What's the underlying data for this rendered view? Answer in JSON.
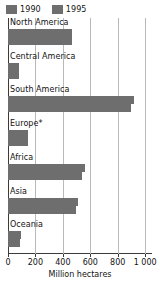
{
  "chart_data": {
    "type": "bar",
    "orientation": "horizontal",
    "title": "",
    "subtitle": "",
    "xlabel": "Million hectares",
    "ylabel": "",
    "xlim": [
      0,
      1050
    ],
    "xticks": [
      0,
      200,
      400,
      600,
      800,
      1000
    ],
    "xticklabels": [
      "0",
      "200",
      "400",
      "600",
      "800",
      "1 000"
    ],
    "grid": true,
    "legend_position": "top-left",
    "categories": [
      "North America",
      "Central America",
      "South America",
      "Europe*",
      "Africa",
      "Asia",
      "Oceania"
    ],
    "series": [
      {
        "name": "1990",
        "color": "#6e6e6e",
        "values": [
          470,
          80,
          922,
          146,
          560,
          510,
          92
        ]
      },
      {
        "name": "1995",
        "color": "#6e6e6e",
        "values": [
          470,
          77,
          895,
          146,
          540,
          495,
          91
        ]
      }
    ],
    "footnote": "*"
  },
  "legend": {
    "items": [
      {
        "label": "1990",
        "color": "#6e6e6e"
      },
      {
        "label": "1995",
        "color": "#6e6e6e"
      }
    ]
  },
  "axis": {
    "title": "Million hectares",
    "ticklabels": [
      "0",
      "200",
      "400",
      "600",
      "800",
      "1 000"
    ]
  },
  "colors": {
    "bar": "#6e6e6e",
    "grid": "#b9b9b9",
    "axis": "#3b3b3b",
    "text": "#121212",
    "background": "#ffffff"
  }
}
